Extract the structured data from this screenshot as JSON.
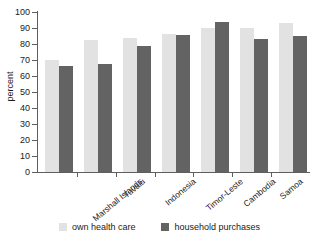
{
  "chart_data": {
    "type": "bar",
    "title": "",
    "xlabel": "",
    "ylabel": "percent",
    "ylim": [
      0,
      100
    ],
    "yticks": [
      0,
      10,
      20,
      30,
      40,
      50,
      60,
      70,
      80,
      90,
      100
    ],
    "grid": false,
    "legend_position": "bottom",
    "categories": [
      "Marshall Islands",
      "Tuvalu",
      "Indonesia",
      "Timor-Leste",
      "Cambodia",
      "Samoa",
      "Philippines"
    ],
    "series": [
      {
        "name": "own health care",
        "color": "#e2e2e2",
        "values": [
          70,
          82.5,
          84,
          86,
          90,
          90,
          93
        ]
      },
      {
        "name": "household purchases",
        "color": "#636363",
        "values": [
          66,
          67.5,
          79,
          85.5,
          94,
          83,
          85
        ]
      }
    ]
  },
  "axis": {
    "y_title": "percent",
    "y_tick_labels": [
      "100",
      "90",
      "80",
      "70",
      "60",
      "50",
      "40",
      "30",
      "20",
      "10",
      "0"
    ]
  },
  "legend": {
    "items": [
      {
        "label": "own health care",
        "color": "#e2e2e2"
      },
      {
        "label": "household purchases",
        "color": "#636363"
      }
    ]
  },
  "header": {
    "cropped_title": ""
  }
}
